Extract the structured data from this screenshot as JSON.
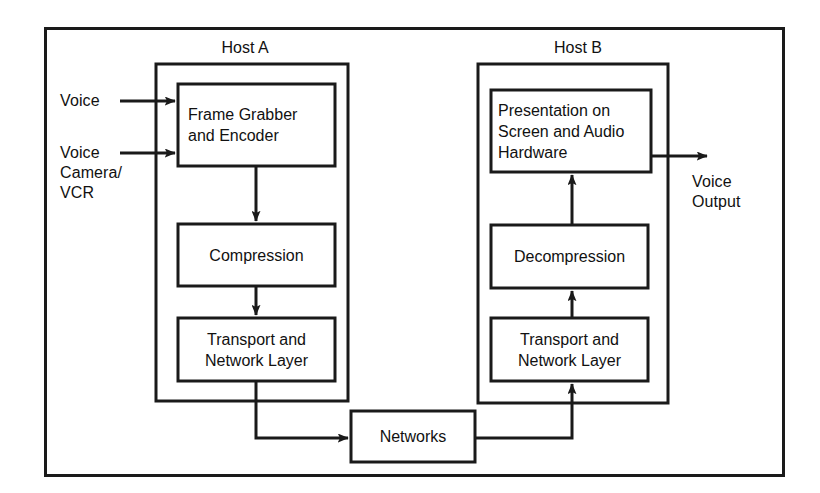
{
  "diagram": {
    "outer_frame": {
      "name": "outer-frame"
    },
    "stroke_color": "#1a1a1a",
    "background_color": "#ffffff"
  },
  "hosts": [
    {
      "id": "host-a",
      "label": "Host A",
      "blocks": [
        {
          "id": "frame-grabber",
          "label": "Frame Grabber\nand Encoder"
        },
        {
          "id": "compression",
          "label": "Compression"
        },
        {
          "id": "transport-a",
          "label": "Transport and\nNetwork Layer"
        }
      ]
    },
    {
      "id": "host-b",
      "label": "Host B",
      "blocks": [
        {
          "id": "presentation",
          "label": "Presentation on\nScreen and Audio\nHardware"
        },
        {
          "id": "decompression",
          "label": "Decompression"
        },
        {
          "id": "transport-b",
          "label": "Transport and\nNetwork Layer"
        }
      ]
    }
  ],
  "network": {
    "id": "networks",
    "label": "Networks"
  },
  "inputs": [
    {
      "id": "input-voice",
      "label": "Voice"
    },
    {
      "id": "input-voice-camera-vcr",
      "label": "Voice\nCamera/\nVCR"
    }
  ],
  "outputs": [
    {
      "id": "output-voice",
      "label": "Voice\nOutput"
    }
  ],
  "flow": {
    "edges": [
      {
        "from": "input-voice",
        "to": "frame-grabber"
      },
      {
        "from": "input-voice-camera-vcr",
        "to": "frame-grabber"
      },
      {
        "from": "frame-grabber",
        "to": "compression"
      },
      {
        "from": "compression",
        "to": "transport-a"
      },
      {
        "from": "transport-a",
        "to": "networks"
      },
      {
        "from": "networks",
        "to": "transport-b"
      },
      {
        "from": "transport-b",
        "to": "decompression"
      },
      {
        "from": "decompression",
        "to": "presentation"
      },
      {
        "from": "presentation",
        "to": "output-voice"
      }
    ]
  }
}
